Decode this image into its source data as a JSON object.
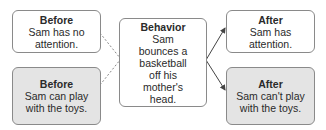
{
  "diagram": {
    "type": "ABC behavior flow",
    "nodes": [
      {
        "id": "before_1",
        "title": "Before",
        "text": "Sam has no attention.",
        "shaded": false
      },
      {
        "id": "before_2",
        "title": "Before",
        "text": "Sam can play with the toys.",
        "shaded": true
      },
      {
        "id": "behavior",
        "title": "Behavior",
        "text": "Sam bounces a basketball off his mother's head.",
        "shaded": false
      },
      {
        "id": "after_1",
        "title": "After",
        "text": "Sam has attention.",
        "shaded": false
      },
      {
        "id": "after_2",
        "title": "After",
        "text": "Sam can't play with the toys.",
        "shaded": true
      }
    ],
    "edges": [
      {
        "from": "before_1",
        "to": "behavior",
        "style": "dotted"
      },
      {
        "from": "before_2",
        "to": "behavior",
        "style": "dotted"
      },
      {
        "from": "behavior",
        "to": "after_1",
        "style": "arrow"
      },
      {
        "from": "behavior",
        "to": "after_2",
        "style": "arrow"
      }
    ]
  },
  "colors": {
    "border": "#8a8a8a",
    "shaded": "#e4e4e4",
    "line": "#555555"
  }
}
